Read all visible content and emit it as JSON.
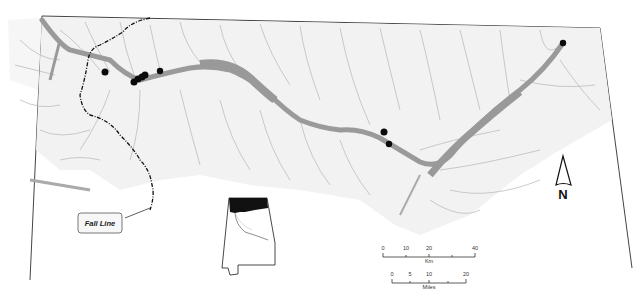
{
  "map": {
    "type": "river-basin-map",
    "colors": {
      "background": "#ffffff",
      "basin_fill": "#f2f2f2",
      "river": "#9a9a9a",
      "tributary": "#b9b9b9",
      "boundary": "#444444",
      "fall_line": "#111111",
      "site_marker": "#0a0a0a",
      "inset_highlight": "#111111"
    },
    "fall_line_label": "Fall Line",
    "sites": [
      {
        "x": 105,
        "y": 72
      },
      {
        "x": 134,
        "y": 82
      },
      {
        "x": 138,
        "y": 79
      },
      {
        "x": 142,
        "y": 77
      },
      {
        "x": 145,
        "y": 75
      },
      {
        "x": 160,
        "y": 71
      },
      {
        "x": 384,
        "y": 132
      },
      {
        "x": 389,
        "y": 144
      },
      {
        "x": 563,
        "y": 43
      }
    ],
    "north_arrow": {
      "label": "N"
    },
    "scale_bars": {
      "km": {
        "ticks": [
          "0",
          "10",
          "20",
          "40"
        ],
        "unit": "Km"
      },
      "miles": {
        "ticks": [
          "0",
          "5",
          "10",
          "20"
        ],
        "unit": "Miles"
      }
    },
    "inset": {
      "description": "Alabama state outline with northern region highlighted"
    }
  }
}
